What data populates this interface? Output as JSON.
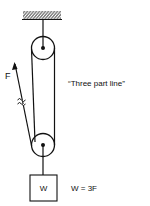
{
  "diagram": {
    "type": "pulley-system",
    "labels": {
      "force": "F",
      "caption": "“Three part line”",
      "weight_block": "W",
      "equation": "W = 3F"
    },
    "colors": {
      "line": "#111111",
      "background": "#ffffff"
    },
    "components": [
      {
        "name": "ceiling-support",
        "kind": "hatched-anchor"
      },
      {
        "name": "top-pulley",
        "kind": "fixed-pulley"
      },
      {
        "name": "bottom-pulley",
        "kind": "movable-pulley"
      },
      {
        "name": "rope",
        "kind": "three-part-line"
      },
      {
        "name": "weight",
        "kind": "load-block"
      }
    ]
  }
}
